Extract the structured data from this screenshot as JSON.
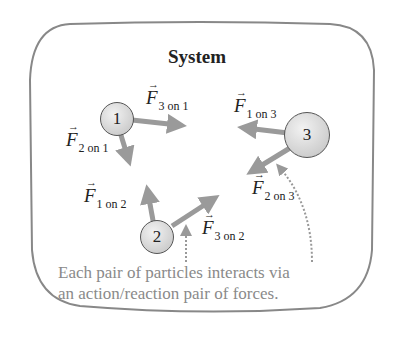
{
  "diagram": {
    "title": "System",
    "particles": [
      {
        "id": "1",
        "label": "1"
      },
      {
        "id": "2",
        "label": "2"
      },
      {
        "id": "3",
        "label": "3"
      }
    ],
    "forces": [
      {
        "symbol": "F",
        "subscript": "3 on 1"
      },
      {
        "symbol": "F",
        "subscript": "2 on 1"
      },
      {
        "symbol": "F",
        "subscript": "1 on 3"
      },
      {
        "symbol": "F",
        "subscript": "2 on 3"
      },
      {
        "symbol": "F",
        "subscript": "1 on 2"
      },
      {
        "symbol": "F",
        "subscript": "3 on 2"
      }
    ],
    "caption_line1": "Each pair of particles interacts via",
    "caption_line2": "an action/reaction pair of forces.",
    "colors": {
      "arrow": "#9a9a9a",
      "border": "#777777",
      "caption": "#8a8a8a",
      "particle_fill": "#d6d6d6"
    }
  }
}
